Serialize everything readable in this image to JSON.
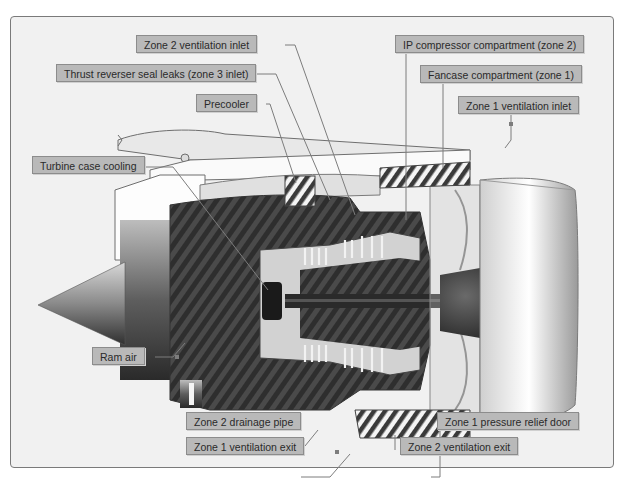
{
  "diagram": {
    "type": "cutaway technical illustration",
    "legend_hint": "hatched areas indicate ventilated compartments/zones"
  },
  "labels": {
    "zone2_ventilation_inlet": "Zone 2 ventilation inlet",
    "thrust_reverser_seal_leaks": "Thrust reverser seal leaks (zone 3 inlet)",
    "precooler": "Precooler",
    "turbine_case_cooling": "Turbine case cooling",
    "ip_compressor_compartment": "IP compressor compartment (zone 2)",
    "fancase_compartment": "Fancase compartment (zone 1)",
    "zone1_ventilation_inlet": "Zone 1 ventilation inlet",
    "ram_air": "Ram air",
    "zone2_drainage_pipe": "Zone 2 drainage pipe",
    "zone1_ventilation_exit": "Zone 1 ventilation exit",
    "zone1_pressure_relief_door": "Zone 1 pressure relief door",
    "zone2_ventilation_exit": "Zone 2 ventilation exit"
  },
  "colors": {
    "background": "#ffffff",
    "panel": "#f1f1f1",
    "label_fill": "#b9b9b9",
    "label_border": "#8c8c8c",
    "hatch_dark": "#3c3c3c",
    "hatch_light": "#7a7a7a",
    "leader_line": "#7d7d7d"
  }
}
